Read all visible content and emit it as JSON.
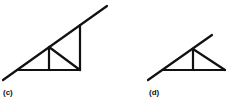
{
  "figures": [
    {
      "id": "c",
      "label": "(c)",
      "description": "Truss with rafter extending beyond; two verticals and one diagonal web",
      "lines": [
        {
          "name": "rafter",
          "x1": 3,
          "y1": 80,
          "x2": 107,
          "y2": 6
        },
        {
          "name": "bottom-chord",
          "x1": 17,
          "y1": 70,
          "x2": 80,
          "y2": 70
        },
        {
          "name": "inner-vertical",
          "x1": 49,
          "y1": 47,
          "x2": 49,
          "y2": 70
        },
        {
          "name": "outer-vertical",
          "x1": 80,
          "y1": 25,
          "x2": 80,
          "y2": 70
        },
        {
          "name": "web-diagonal",
          "x1": 49,
          "y1": 47,
          "x2": 80,
          "y2": 70
        }
      ]
    },
    {
      "id": "d",
      "label": "(d)",
      "description": "Truss with rafter extending beyond; one vertical and one diagonal web",
      "lines": [
        {
          "name": "rafter",
          "x1": 148,
          "y1": 80,
          "x2": 212,
          "y2": 35
        },
        {
          "name": "bottom-chord",
          "x1": 163,
          "y1": 70,
          "x2": 225,
          "y2": 70
        },
        {
          "name": "vertical",
          "x1": 193,
          "y1": 49,
          "x2": 193,
          "y2": 70
        },
        {
          "name": "web-diagonal",
          "x1": 193,
          "y1": 49,
          "x2": 225,
          "y2": 70
        }
      ]
    }
  ],
  "colors": {
    "stroke": "#111111",
    "background": "#ffffff"
  }
}
